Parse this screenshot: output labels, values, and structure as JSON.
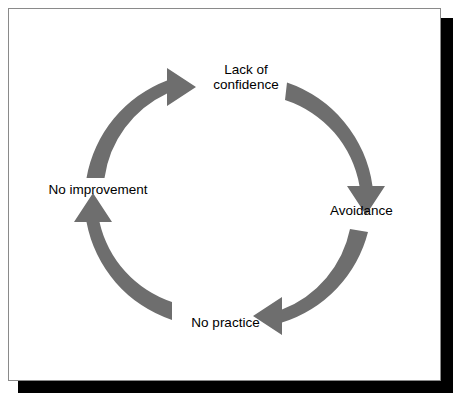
{
  "figure": {
    "type": "cycle-diagram",
    "title": "",
    "background_color": "#ffffff",
    "frame_border_color": "#8a8a8a",
    "shadow_color": "#000000",
    "arrow_color": "#6e6e6e",
    "label_color": "#000000",
    "direction": "clockwise"
  },
  "diagram": {
    "nodes": [
      {
        "id": "lack-of-confidence",
        "label_line1": "Lack of",
        "label_line2": "confidence",
        "position": "top"
      },
      {
        "id": "avoidance",
        "label": "Avoidance",
        "position": "right"
      },
      {
        "id": "no-practice",
        "label": "No practice",
        "position": "bottom"
      },
      {
        "id": "no-improvement",
        "label": "No improvement",
        "position": "left"
      }
    ],
    "arrows": [
      {
        "id": "arrow-left-to-top",
        "from": "no-improvement",
        "to": "lack-of-confidence",
        "points": "right"
      },
      {
        "id": "arrow-top-to-right",
        "from": "lack-of-confidence",
        "to": "avoidance",
        "points": "down"
      },
      {
        "id": "arrow-right-to-bottom",
        "from": "avoidance",
        "to": "no-practice",
        "points": "left"
      },
      {
        "id": "arrow-bottom-to-left",
        "from": "no-practice",
        "to": "no-improvement",
        "points": "up"
      }
    ]
  }
}
